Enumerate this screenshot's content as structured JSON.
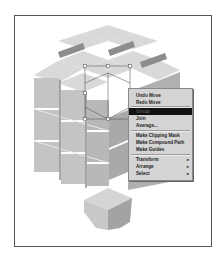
{
  "context_menu": {
    "items": [
      {
        "label": "Undo Move",
        "top": 3
      },
      {
        "label": "Redo Move",
        "top": 10
      },
      {
        "label": "Group",
        "top": 19,
        "highlighted": true
      },
      {
        "label": "Join",
        "top": 26
      },
      {
        "label": "Average...",
        "top": 33
      },
      {
        "label": "Make Clipping Mask",
        "top": 43
      },
      {
        "label": "Make Compound Path",
        "top": 50
      },
      {
        "label": "Make Guides",
        "top": 57
      },
      {
        "label": "Transform",
        "top": 67,
        "submenu": true
      },
      {
        "label": "Arrange",
        "top": 74,
        "submenu": true
      },
      {
        "label": "Select",
        "top": 81,
        "submenu": true
      }
    ],
    "separators": [
      17,
      41,
      65
    ],
    "submenu_arrow": "▸"
  },
  "colors": {
    "top_face": "#d9d9d9",
    "left_face": "#c4c4c4",
    "right_face": "#a9a9a9",
    "gap": "#8d8d8d",
    "highlight": "#111111"
  }
}
